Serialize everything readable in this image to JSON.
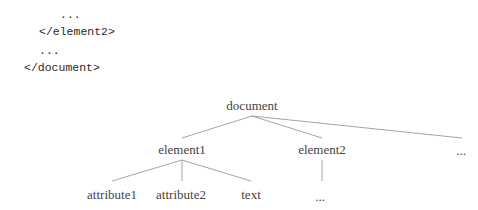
{
  "code_snippet": {
    "lines": [
      {
        "text": "...",
        "indent_px": 60,
        "top": 6
      },
      {
        "text": "</element2>",
        "indent_px": 39,
        "top": 23
      },
      {
        "text": "...",
        "indent_px": 39,
        "top": 42
      },
      {
        "text": "</document>",
        "indent_px": 24,
        "top": 59
      }
    ]
  },
  "tree": {
    "root": {
      "label": "document",
      "x": 252,
      "y": 98
    },
    "level1": [
      {
        "label": "element1",
        "x": 182,
        "y": 142
      },
      {
        "label": "element2",
        "x": 322,
        "y": 142
      },
      {
        "label": "...",
        "x": 461,
        "y": 143
      }
    ],
    "level2": [
      {
        "label": "attribute1",
        "x": 112,
        "y": 187
      },
      {
        "label": "attribute2",
        "x": 181,
        "y": 187
      },
      {
        "label": "text",
        "x": 251,
        "y": 187
      },
      {
        "label": "...",
        "x": 320,
        "y": 189
      }
    ],
    "edge_color": "#9a9a9a"
  }
}
